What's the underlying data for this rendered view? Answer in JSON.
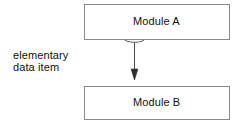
{
  "diagram": {
    "type": "module-data-flow",
    "canvas": {
      "width": 244,
      "height": 127,
      "background": "#ffffff"
    },
    "style": {
      "line_color": "#8a8a8a",
      "arrow_color": "#3a3a3a",
      "text_color": "#111111",
      "fill_color": "#ffffff"
    },
    "nodes": [
      {
        "id": "module-a",
        "label": "Module A",
        "shape": "rectangle",
        "x": 84,
        "y": 4,
        "width": 146,
        "height": 36
      },
      {
        "id": "module-b",
        "label": "Module B",
        "shape": "rectangle",
        "x": 84,
        "y": 86,
        "width": 146,
        "height": 34
      }
    ],
    "connectors": [
      {
        "id": "data-flow-arrow",
        "from": "module-a",
        "to": "module-b",
        "marker": "ellipse",
        "marker_shape": "open-ellipse",
        "head": "solid-triangle",
        "direction": "down"
      }
    ],
    "annotations": [
      {
        "id": "elementary-data-item",
        "line1": "elementary",
        "line2": "data item"
      }
    ]
  }
}
